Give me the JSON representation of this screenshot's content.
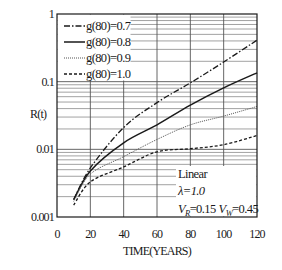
{
  "chart_data": {
    "type": "line",
    "title": "",
    "xlabel": "TIME(YEARS)",
    "ylabel": "R(t)",
    "xlim": [
      0,
      120
    ],
    "ylim": [
      0.001,
      1
    ],
    "yscale": "log",
    "grid": true,
    "legend_position": "upper left",
    "x_ticks": [
      "0",
      "20",
      "40",
      "60",
      "80",
      "100",
      "120"
    ],
    "y_ticks": [
      "0.001",
      "0.01",
      "0.1",
      "1"
    ],
    "x": [
      10,
      20,
      40,
      60,
      80,
      100,
      120
    ],
    "series": [
      {
        "name": "g(80)=0.7",
        "style": "dash-dot",
        "values": [
          0.0018,
          0.0053,
          0.021,
          0.049,
          0.096,
          0.195,
          0.41
        ]
      },
      {
        "name": "g(80)=0.8",
        "style": "solid",
        "values": [
          0.0018,
          0.0048,
          0.0125,
          0.023,
          0.045,
          0.081,
          0.135
        ]
      },
      {
        "name": "g(80)=0.9",
        "style": "dotted",
        "values": [
          0.0017,
          0.0043,
          0.0078,
          0.014,
          0.023,
          0.031,
          0.043
        ]
      },
      {
        "name": "g(80)=1.0",
        "style": "dashed",
        "values": [
          0.0015,
          0.0033,
          0.0055,
          0.0092,
          0.0102,
          0.0117,
          0.016
        ]
      }
    ],
    "annotations": [
      "Linear",
      "λ=1.0",
      "V_R=0.15 V_W=0.45"
    ]
  },
  "legend": {
    "items": [
      {
        "label": "g(80)=0.7"
      },
      {
        "label": "g(80)=0.8"
      },
      {
        "label": "g(80)=0.9"
      },
      {
        "label": "g(80)=1.0"
      }
    ]
  },
  "annotation": {
    "line1": "Linear",
    "line2": "λ=1.0",
    "vr_symbol": "V",
    "vr_sub": "R",
    "vr_value": "=0.15",
    "vw_symbol": "V",
    "vw_sub": "W",
    "vw_value": "=0.45"
  },
  "axes": {
    "x_label": "TIME(YEARS)",
    "y_label": "R(t)"
  }
}
